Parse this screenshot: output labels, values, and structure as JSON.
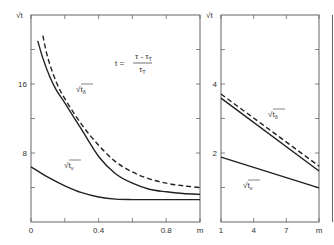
{
  "chart_data": [
    {
      "type": "line",
      "panel": "left",
      "title": "",
      "formula": {
        "lhs": "t =",
        "numerator": "τ - τ",
        "numerator_sub": "T",
        "denominator": "τ",
        "denominator_sub": "T"
      },
      "xlabel": "m",
      "ylabel": "√t",
      "xlim": [
        0,
        1.0
      ],
      "ylim": [
        0,
        24
      ],
      "x_ticks": [
        0,
        0.2,
        0.4,
        0.6,
        0.8,
        1.0
      ],
      "x_tick_labels": [
        {
          "value": 0,
          "label": "0"
        },
        {
          "value": 0.4,
          "label": "0.4"
        },
        {
          "value": 0.8,
          "label": "0.8"
        },
        {
          "value": 1.0,
          "label": "m"
        }
      ],
      "y_ticks": [
        4,
        8,
        12,
        16,
        20
      ],
      "y_tick_labels": [
        {
          "value": 8,
          "label": "8"
        },
        {
          "value": 16,
          "label": "16"
        }
      ],
      "series": [
        {
          "name": "√t_δ (dashed)",
          "style": "dashed",
          "label": "",
          "x": [
            0.07,
            0.1,
            0.15,
            0.2,
            0.3,
            0.4,
            0.5,
            0.6,
            0.7,
            0.8,
            0.9,
            1.0
          ],
          "y": [
            21.6,
            19.0,
            16.2,
            14.3,
            11.3,
            8.9,
            7.0,
            5.8,
            5.0,
            4.5,
            4.2,
            4.0
          ]
        },
        {
          "name": "√t_δ (solid)",
          "style": "solid",
          "label": "√t",
          "label_sub": "δ",
          "x": [
            0.04,
            0.07,
            0.11,
            0.15,
            0.2,
            0.3,
            0.4,
            0.5,
            0.6,
            0.7,
            0.8,
            0.9,
            1.0
          ],
          "y": [
            21.0,
            19.0,
            16.9,
            15.3,
            13.8,
            10.7,
            7.6,
            5.6,
            4.5,
            3.8,
            3.5,
            3.3,
            3.2
          ]
        },
        {
          "name": "√t_v",
          "style": "solid",
          "label": "√t",
          "label_sub": "v",
          "x": [
            0,
            0.1,
            0.2,
            0.3,
            0.4,
            0.5,
            0.6,
            0.7,
            0.8,
            0.9,
            1.0
          ],
          "y": [
            6.4,
            5.2,
            4.2,
            3.4,
            2.9,
            2.65,
            2.6,
            2.6,
            2.6,
            2.6,
            2.6
          ]
        }
      ]
    },
    {
      "type": "line",
      "panel": "right",
      "title": "",
      "xlabel": "m",
      "ylabel": "√t",
      "xlim": [
        1,
        10
      ],
      "ylim": [
        0,
        6
      ],
      "x_ticks": [
        1,
        4,
        7,
        10
      ],
      "x_tick_labels": [
        {
          "value": 1,
          "label": "1"
        },
        {
          "value": 4,
          "label": "4"
        },
        {
          "value": 7,
          "label": "7"
        },
        {
          "value": 10,
          "label": "m"
        }
      ],
      "y_ticks": [
        1,
        2,
        3,
        4,
        5
      ],
      "y_tick_labels": [
        {
          "value": 2,
          "label": "2"
        },
        {
          "value": 4,
          "label": "4"
        }
      ],
      "series": [
        {
          "name": "√t_δ (dashed)",
          "style": "dashed",
          "label": "",
          "x": [
            1,
            10
          ],
          "y": [
            3.71,
            1.62
          ]
        },
        {
          "name": "√t_δ (solid)",
          "style": "solid",
          "label": "√t",
          "label_sub": "δ",
          "x": [
            1,
            10
          ],
          "y": [
            3.59,
            1.48
          ]
        },
        {
          "name": "√t_v",
          "style": "solid",
          "label": "√t",
          "label_sub": "v",
          "x": [
            1,
            10
          ],
          "y": [
            1.88,
            0.99
          ]
        }
      ]
    }
  ]
}
